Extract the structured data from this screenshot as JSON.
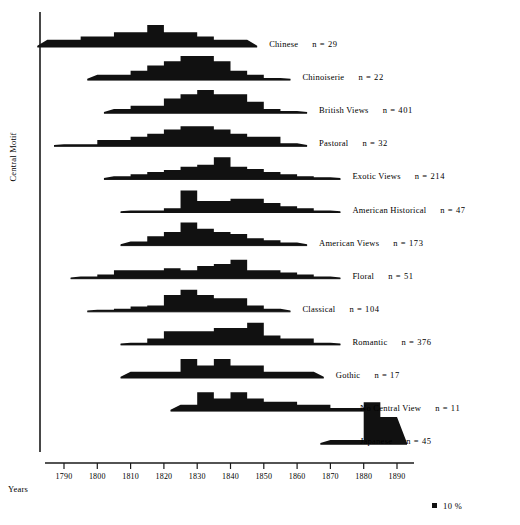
{
  "chart_data": {
    "type": "area",
    "title": "",
    "xlabel": "Years",
    "ylabel": "Central Motif",
    "xlim": [
      1785,
      1895
    ],
    "grid": false,
    "legend": {
      "position": "bottom-right",
      "swatch": "black-square",
      "label": "10 %"
    },
    "x_ticks": [
      1790,
      1800,
      1810,
      1820,
      1830,
      1840,
      1850,
      1860,
      1870,
      1880,
      1890
    ],
    "bin_width_years": 5,
    "value_unit": "percent",
    "series": [
      {
        "name": "Chinese",
        "label": "Chinese",
        "n_label": "n = 29",
        "n": 29,
        "bins": [
          1785,
          1790,
          1795,
          1800,
          1805,
          1810,
          1815,
          1820,
          1825,
          1830,
          1835,
          1840
        ],
        "values": [
          7,
          7,
          10,
          10,
          14,
          14,
          21,
          14,
          14,
          10,
          7,
          7
        ]
      },
      {
        "name": "Chinoiserie",
        "label": "Chinoiserie",
        "n_label": "n = 22",
        "n": 22,
        "bins": [
          1800,
          1805,
          1810,
          1815,
          1820,
          1825,
          1830,
          1835,
          1840,
          1845,
          1850
        ],
        "values": [
          5,
          5,
          9,
          14,
          18,
          23,
          23,
          18,
          9,
          5,
          2
        ]
      },
      {
        "name": "British Views",
        "label": "British Views",
        "n_label": "n = 401",
        "n": 401,
        "bins": [
          1805,
          1810,
          1815,
          1820,
          1825,
          1830,
          1835,
          1840,
          1845,
          1850,
          1855
        ],
        "values": [
          4,
          7,
          7,
          14,
          18,
          22,
          18,
          18,
          11,
          4,
          2
        ]
      },
      {
        "name": "Pastoral",
        "label": "Pastoral",
        "n_label": "n = 32",
        "n": 32,
        "bins": [
          1790,
          1795,
          1800,
          1805,
          1810,
          1815,
          1820,
          1825,
          1830,
          1835,
          1840,
          1845,
          1850,
          1855
        ],
        "values": [
          2,
          2,
          6,
          6,
          9,
          12,
          16,
          19,
          19,
          16,
          12,
          9,
          9,
          3
        ]
      },
      {
        "name": "Exotic Views",
        "label": "Exotic Views",
        "n_label": "n = 214",
        "n": 214,
        "bins": [
          1805,
          1810,
          1815,
          1820,
          1825,
          1830,
          1835,
          1840,
          1845,
          1850,
          1855,
          1860,
          1865
        ],
        "values": [
          3,
          5,
          7,
          9,
          12,
          14,
          21,
          12,
          10,
          7,
          5,
          3,
          2
        ]
      },
      {
        "name": "American Historical",
        "label": "American Historical",
        "n_label": "n = 47",
        "n": 47,
        "bins": [
          1810,
          1815,
          1820,
          1825,
          1830,
          1835,
          1840,
          1845,
          1850,
          1855,
          1860,
          1865
        ],
        "values": [
          2,
          2,
          4,
          21,
          11,
          11,
          13,
          13,
          9,
          6,
          4,
          2
        ]
      },
      {
        "name": "American Views",
        "label": "American Views",
        "n_label": "n = 173",
        "n": 173,
        "bins": [
          1810,
          1815,
          1820,
          1825,
          1830,
          1835,
          1840,
          1845,
          1850,
          1855
        ],
        "values": [
          4,
          9,
          13,
          22,
          16,
          13,
          11,
          7,
          5,
          3
        ]
      },
      {
        "name": "Floral",
        "label": "Floral",
        "n_label": "n = 51",
        "n": 51,
        "bins": [
          1795,
          1800,
          1805,
          1810,
          1815,
          1820,
          1825,
          1830,
          1835,
          1840,
          1845,
          1850,
          1855,
          1860,
          1865
        ],
        "values": [
          2,
          4,
          8,
          8,
          8,
          10,
          8,
          12,
          14,
          18,
          8,
          8,
          6,
          4,
          2
        ]
      },
      {
        "name": "Classical",
        "label": "Classical",
        "n_label": "n = 104",
        "n": 104,
        "bins": [
          1800,
          1805,
          1810,
          1815,
          1820,
          1825,
          1830,
          1835,
          1840,
          1845,
          1850
        ],
        "values": [
          2,
          3,
          5,
          6,
          16,
          21,
          16,
          13,
          13,
          6,
          3
        ]
      },
      {
        "name": "Romantic",
        "label": "Romantic",
        "n_label": "n = 376",
        "n": 376,
        "bins": [
          1810,
          1815,
          1820,
          1825,
          1830,
          1835,
          1840,
          1845,
          1850,
          1855,
          1860,
          1865
        ],
        "values": [
          2,
          6,
          13,
          13,
          13,
          16,
          16,
          21,
          9,
          6,
          6,
          2
        ]
      },
      {
        "name": "Gothic",
        "label": "Gothic",
        "n_label": "n = 17",
        "n": 17,
        "bins": [
          1810,
          1815,
          1820,
          1825,
          1830,
          1835,
          1840,
          1845,
          1850,
          1855,
          1860
        ],
        "values": [
          6,
          6,
          6,
          18,
          12,
          18,
          12,
          12,
          6,
          6,
          6
        ]
      },
      {
        "name": "No Central View",
        "label": "No Central View",
        "n_label": "n = 11",
        "n": 11,
        "bins": [
          1825,
          1830,
          1835,
          1840,
          1845,
          1850,
          1855,
          1860,
          1865,
          1870,
          1875
        ],
        "values": [
          6,
          18,
          12,
          18,
          12,
          9,
          9,
          6,
          6,
          3,
          3
        ]
      },
      {
        "name": "Japanese",
        "label": "Japanese",
        "n_label": "n = 45",
        "n": 45,
        "bins": [
          1870,
          1875,
          1880,
          1885
        ],
        "values": [
          4,
          4,
          40,
          26
        ]
      }
    ]
  },
  "axis": {
    "y_label": "Central Motif",
    "x_label": "Years",
    "tick_labels": [
      "1790",
      "1800",
      "1810",
      "1820",
      "1830",
      "1840",
      "1850",
      "1860",
      "1870",
      "1880",
      "1890"
    ]
  },
  "legend": {
    "swatch_name": "black-square-swatch",
    "text": "10 %"
  },
  "colors": {
    "fill": "#111111",
    "axis": "#1a1a1a",
    "background": "#ffffff"
  }
}
